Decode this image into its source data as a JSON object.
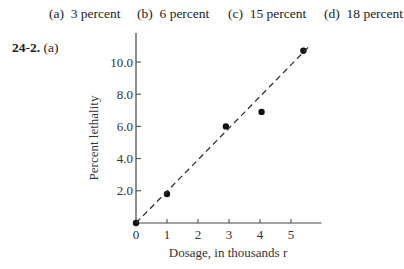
{
  "answer_options": [
    {
      "label": "(a)",
      "text": "3 percent"
    },
    {
      "label": "(b)",
      "text": "6 percent"
    },
    {
      "label": "(c)",
      "text": "15 percent"
    },
    {
      "label": "(d)",
      "text": "18 percent"
    }
  ],
  "question": {
    "number": "24-2.",
    "part": "(a)"
  },
  "chart_data": {
    "type": "scatter",
    "title": "",
    "xlabel": "Dosage, in thousands r",
    "ylabel": "Percent lethality",
    "x_ticks": [
      "0",
      "1",
      "2",
      "3",
      "4",
      "5"
    ],
    "y_ticks": [
      "2.0",
      "4.0",
      "6.0",
      "8.0",
      "10.0"
    ],
    "xlim": [
      0,
      6
    ],
    "ylim": [
      0,
      11.8
    ],
    "grid": false,
    "series": [
      {
        "name": "observed",
        "marker": "filled-circle",
        "points": [
          {
            "x": 0,
            "y": 0
          },
          {
            "x": 1.0,
            "y": 1.8
          },
          {
            "x": 2.9,
            "y": 6.0
          },
          {
            "x": 4.05,
            "y": 6.9
          },
          {
            "x": 5.4,
            "y": 10.7
          }
        ]
      },
      {
        "name": "fit line",
        "style": "dashed",
        "points": [
          {
            "x": 0,
            "y": 0
          },
          {
            "x": 5.55,
            "y": 10.9
          }
        ]
      }
    ]
  }
}
